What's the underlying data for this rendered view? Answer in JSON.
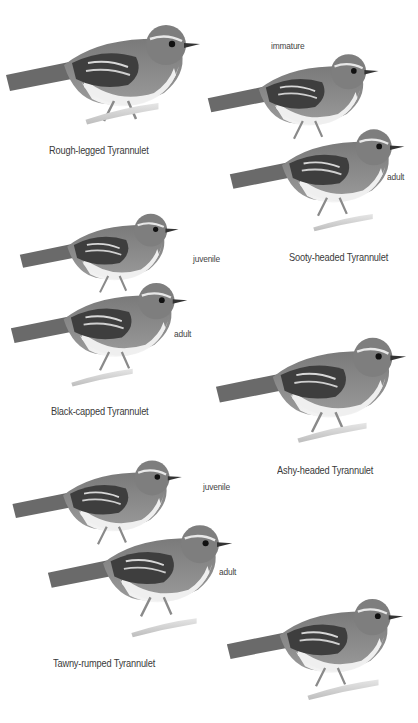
{
  "plate": {
    "species": [
      {
        "name": "Rough-legged Tyrannulet",
        "forms": []
      },
      {
        "name": "Sooty-headed Tyrannulet",
        "forms": [
          "immature",
          "adult"
        ]
      },
      {
        "name": "Black-capped Tyrannulet",
        "forms": [
          "juvenile",
          "adult"
        ]
      },
      {
        "name": "Ashy-headed Tyrannulet",
        "forms": []
      },
      {
        "name": "Tawny-rumped Tyrannulet",
        "forms": [
          "juvenile",
          "adult"
        ]
      }
    ]
  },
  "labels": {
    "rough_legged": "Rough-legged Tyrannulet",
    "sooty_headed": "Sooty-headed Tyrannulet",
    "sooty_immature": "immature",
    "sooty_adult": "adult",
    "black_capped": "Black-capped Tyrannulet",
    "black_capped_juvenile": "juvenile",
    "black_capped_adult": "adult",
    "ashy_headed": "Ashy-headed Tyrannulet",
    "tawny_rumped": "Tawny-rumped Tyrannulet",
    "tawny_juvenile": "juvenile",
    "tawny_adult": "adult"
  }
}
